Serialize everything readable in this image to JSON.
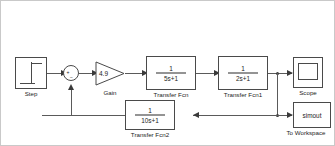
{
  "diagram": {
    "type": "simulink-block-diagram",
    "background_color": "#ffffff",
    "line_color": "#5a5a5a",
    "block_border_color": "#4a4a4a",
    "text_color": "#1c1c1c"
  },
  "blocks": {
    "step": {
      "label": "Step",
      "icon": "step-waveform-icon"
    },
    "sum": {
      "label": "",
      "plus_sign": "+",
      "minus_sign": "−",
      "icon": "sum-junction-icon"
    },
    "gain": {
      "value": "4.9",
      "label": "Gain",
      "icon": "gain-triangle-icon"
    },
    "transfer_fcn": {
      "numerator": "1",
      "denominator": "5s+1",
      "label": "Transfer Fcn"
    },
    "transfer_fcn1": {
      "numerator": "1",
      "denominator": "2s+1",
      "label": "Transfer Fcn1"
    },
    "transfer_fcn2": {
      "numerator": "1",
      "denominator": "10s+1",
      "label": "Transfer Fcn2"
    },
    "scope": {
      "label": "Scope",
      "icon": "scope-screen-icon"
    },
    "to_workspace": {
      "variable": "simout",
      "label": "To Workspace"
    }
  }
}
